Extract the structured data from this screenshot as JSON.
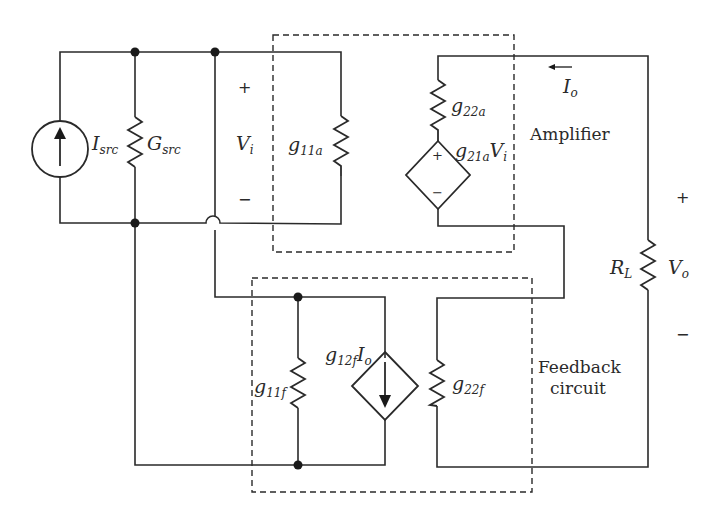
{
  "blocks": {
    "amplifier": "Amplifier",
    "feedback_line1": "Feedback",
    "feedback_line2": "circuit"
  },
  "components": {
    "isrc": {
      "main": "I",
      "sub": "src"
    },
    "gsrc": {
      "main": "G",
      "sub": "src"
    },
    "g11a": {
      "main": "g",
      "sub": "11a"
    },
    "g22a": {
      "main": "g",
      "sub": "22a"
    },
    "g21a": {
      "main": "g",
      "sub": "21a",
      "ctrl": "V",
      "ctrl_sub": "i"
    },
    "g11f": {
      "main": "g",
      "sub": "11f"
    },
    "g12f": {
      "main": "g",
      "sub": "12f",
      "ctrl": "I",
      "ctrl_sub": "o"
    },
    "g22f": {
      "main": "g",
      "sub": "22f"
    },
    "rl": {
      "main": "R",
      "sub": "L"
    }
  },
  "signals": {
    "vi": {
      "main": "V",
      "sub": "i",
      "plus": "+",
      "minus": "−"
    },
    "vo": {
      "main": "V",
      "sub": "o",
      "plus": "+",
      "minus": "−"
    },
    "io": {
      "main": "I",
      "sub": "o",
      "arrow": "←"
    },
    "vcvs_plus": "+",
    "vcvs_minus": "−"
  }
}
